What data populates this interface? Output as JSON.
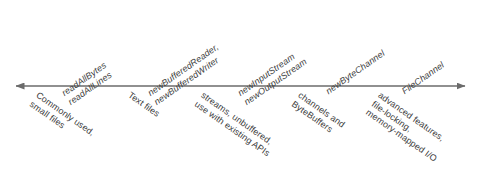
{
  "diagram": {
    "axis": {
      "name": "double-headed-arrow",
      "left_arrowhead": true,
      "right_arrowhead": true,
      "color": "#6b6b6b",
      "y": 86,
      "x_start": 15,
      "x_end": 466
    },
    "colors": {
      "background": "#ffffff",
      "text": "#3c3c3c",
      "arrow": "#6b6b6b"
    },
    "api_labels": [
      {
        "id": "read-all",
        "x": 72,
        "lines": [
          "readAllBytes",
          "readAllLines"
        ]
      },
      {
        "id": "new-buffered",
        "x": 158,
        "lines": [
          "newBufferedReader,",
          "newBufferedWriter"
        ]
      },
      {
        "id": "new-stream",
        "x": 248,
        "lines": [
          "newInputStream",
          "newOutputStream"
        ]
      },
      {
        "id": "new-byte-channel",
        "x": 330,
        "lines": [
          "newByteChannel"
        ]
      },
      {
        "id": "file-channel",
        "x": 406,
        "lines": [
          "FileChannel"
        ]
      }
    ],
    "description_labels": [
      {
        "id": "commonly-used",
        "x": 40,
        "lines": [
          "Commonly used,",
          "small files"
        ]
      },
      {
        "id": "text-files",
        "x": 132,
        "lines": [
          "Text files"
        ]
      },
      {
        "id": "streams-unbuffered",
        "x": 205,
        "lines": [
          "streams, unbuffered,",
          "use with existing APIs"
        ]
      },
      {
        "id": "channels-bytebuffers",
        "x": 302,
        "lines": [
          "channels and",
          "ByteBuffers"
        ]
      },
      {
        "id": "advanced-features",
        "x": 382,
        "lines": [
          "advanced features,",
          "file-locking,",
          "memory-mapped I/O"
        ]
      }
    ]
  }
}
